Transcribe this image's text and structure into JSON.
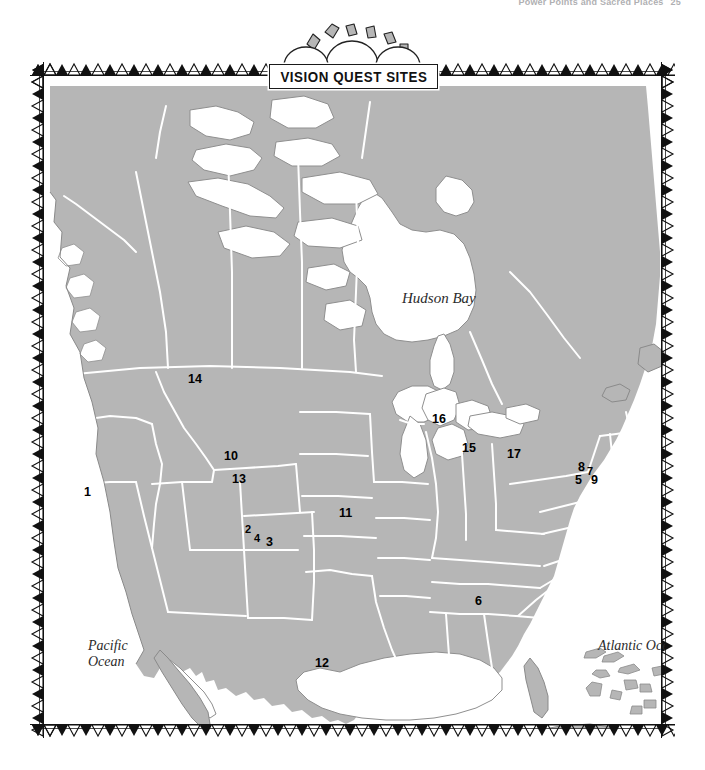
{
  "page": {
    "running_head": "Power Points and Sacred Places",
    "folio": "25"
  },
  "banner": {
    "title": "VISION QUEST SITES",
    "motif": "sun-over-mountains"
  },
  "map": {
    "region": "North America",
    "land_color": "#b6b6b6",
    "land_outline_color": "#7a7a7a",
    "water_color": "#ffffff",
    "border_line_color": "#ffffff",
    "frame_color": "#4a4a4a",
    "water_labels": [
      {
        "name": "hudson-bay",
        "text": "Hudson Bay"
      },
      {
        "name": "pacific-ocean",
        "text": "Pacific\nOcean"
      },
      {
        "name": "atlantic-ocean",
        "text": "Atlantic Ocean"
      },
      {
        "name": "gulf-of-mexico",
        "text": "Gulf of Mexico"
      }
    ],
    "sites": [
      {
        "id": "1",
        "label": "1",
        "x": 74,
        "y": 443
      },
      {
        "id": "2",
        "label": "2",
        "x": 235,
        "y": 482
      },
      {
        "id": "4",
        "label": "4",
        "x": 244,
        "y": 491
      },
      {
        "id": "3",
        "label": "3",
        "x": 256,
        "y": 495
      },
      {
        "id": "5",
        "label": "5",
        "x": 565,
        "y": 432
      },
      {
        "id": "6",
        "label": "6",
        "x": 465,
        "y": 553
      },
      {
        "id": "7",
        "label": "7",
        "x": 577,
        "y": 424
      },
      {
        "id": "8",
        "label": "8",
        "x": 568,
        "y": 419
      },
      {
        "id": "9",
        "label": "9",
        "x": 581,
        "y": 432
      },
      {
        "id": "10",
        "label": "10",
        "x": 214,
        "y": 408
      },
      {
        "id": "11",
        "label": "11",
        "x": 329,
        "y": 465
      },
      {
        "id": "12",
        "label": "12",
        "x": 305,
        "y": 615
      },
      {
        "id": "13",
        "label": "13",
        "x": 222,
        "y": 431
      },
      {
        "id": "14",
        "label": "14",
        "x": 178,
        "y": 331
      },
      {
        "id": "15",
        "label": "15",
        "x": 452,
        "y": 400
      },
      {
        "id": "16",
        "label": "16",
        "x": 422,
        "y": 371
      },
      {
        "id": "17",
        "label": "17",
        "x": 497,
        "y": 406
      }
    ]
  }
}
